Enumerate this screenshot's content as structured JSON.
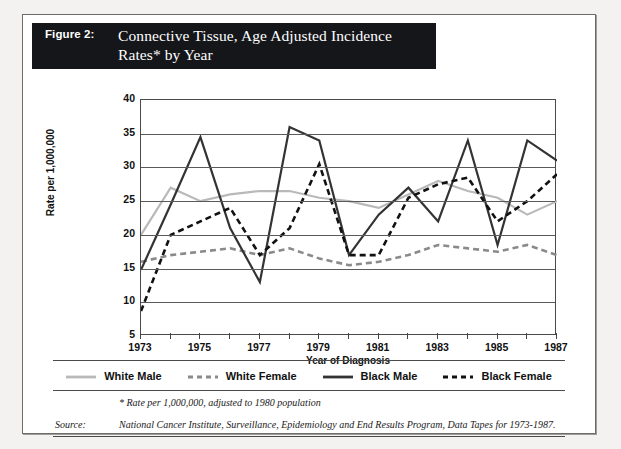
{
  "figure": {
    "label": "Figure 2:",
    "title": "Connective Tissue, Age Adjusted Incidence Rates* by Year"
  },
  "notes": {
    "star": "* Rate per 1,000,000, adjusted to 1980 population",
    "source_label": "Source:",
    "source_text": "National Cancer Institute, Surveillance, Epidemiology and End Results Program, Data Tapes for 1973-1987."
  },
  "legend": {
    "position": "bottom",
    "items": [
      {
        "label": "White Male",
        "color": "#b9b9b9",
        "style": "solid"
      },
      {
        "label": "White Female",
        "color": "#8a8a8a",
        "style": "dashed"
      },
      {
        "label": "Black Male",
        "color": "#333333",
        "style": "solid"
      },
      {
        "label": "Black Female",
        "color": "#111111",
        "style": "dashed"
      }
    ]
  },
  "chart_data": {
    "type": "line",
    "title": "Connective Tissue, Age Adjusted Incidence Rates* by Year",
    "xlabel": "Year of Diagnosis",
    "ylabel": "Rate per 1,000,000",
    "x": [
      1973,
      1974,
      1975,
      1976,
      1977,
      1978,
      1979,
      1980,
      1981,
      1982,
      1983,
      1984,
      1985,
      1986,
      1987
    ],
    "xlim": [
      1973,
      1987
    ],
    "ylim": [
      5,
      40
    ],
    "yticks": [
      5,
      10,
      15,
      20,
      25,
      30,
      35,
      40
    ],
    "xticks_labeled": [
      1973,
      1975,
      1977,
      1979,
      1981,
      1983,
      1985,
      1987
    ],
    "grid": true,
    "series": [
      {
        "name": "White Male",
        "color": "#b9b9b9",
        "style": "solid",
        "values": [
          20,
          27,
          25,
          26,
          26.5,
          26.5,
          25.5,
          25,
          24,
          26,
          28,
          26.5,
          25.5,
          23,
          25
        ]
      },
      {
        "name": "White Female",
        "color": "#8a8a8a",
        "style": "dashed",
        "values": [
          16,
          17,
          17.5,
          18,
          17,
          18,
          16.5,
          15.5,
          16,
          17,
          18.5,
          18,
          17.5,
          18.5,
          17
        ]
      },
      {
        "name": "Black Male",
        "color": "#333333",
        "style": "solid",
        "values": [
          14.8,
          24.5,
          34.5,
          21,
          13,
          36,
          34,
          17,
          23,
          27,
          22,
          34,
          18.5,
          34,
          31
        ]
      },
      {
        "name": "Black Female",
        "color": "#111111",
        "style": "dashed",
        "values": [
          8.7,
          20,
          22,
          24,
          17,
          21,
          30.5,
          17,
          17,
          25.5,
          27.5,
          28.5,
          22,
          25,
          29
        ]
      }
    ]
  }
}
